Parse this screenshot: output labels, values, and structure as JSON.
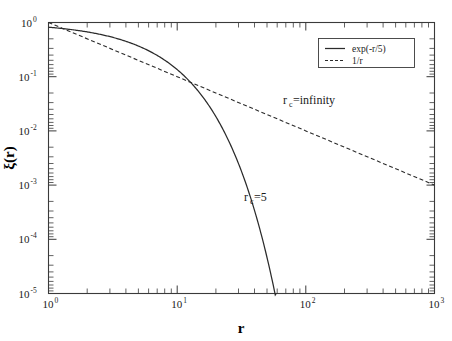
{
  "chart_data": {
    "type": "line",
    "title": "",
    "xlabel": "r",
    "ylabel": "ξ(r)",
    "xscale": "log",
    "yscale": "log",
    "xlim": [
      1,
      1000
    ],
    "ylim": [
      1e-05,
      1
    ],
    "grid": false,
    "legend_position": "top-right",
    "xticklabels": [
      "10",
      "10",
      "10",
      "10"
    ],
    "xtickexponents": [
      "0",
      "1",
      "2",
      "3"
    ],
    "xtickvalues": [
      1,
      10,
      100,
      1000
    ],
    "yticklabels": [
      "10",
      "10",
      "10",
      "10",
      "10",
      "10"
    ],
    "ytickexponents": [
      "0",
      "-1",
      "-2",
      "-3",
      "-4",
      "-5"
    ],
    "ytickvalues": [
      1,
      0.1,
      0.01,
      0.001,
      0.0001,
      1e-05
    ],
    "series": [
      {
        "name": "exp(-r/5)",
        "style": "solid",
        "color": "#2b2b2b",
        "formula": "exp(-r/5)",
        "x": [
          1,
          1.5,
          2,
          3,
          4,
          5,
          6,
          8,
          10,
          12,
          14,
          16,
          18,
          20,
          25,
          30,
          35,
          40,
          45,
          50,
          55,
          57.6
        ],
        "y": [
          0.8187,
          0.7408,
          0.6703,
          0.5488,
          0.4493,
          0.3679,
          0.3012,
          0.2019,
          0.1353,
          0.0907,
          0.0608,
          0.0408,
          0.0273,
          0.0183,
          0.00674,
          0.00248,
          0.000912,
          0.000335,
          0.000123,
          4.54e-05,
          1.67e-05,
          1e-05
        ]
      },
      {
        "name": "1/r",
        "style": "dashed",
        "color": "#2b2b2b",
        "formula": "1/r",
        "x": [
          1,
          10,
          100,
          1000
        ],
        "y": [
          1,
          0.1,
          0.01,
          0.001
        ]
      }
    ],
    "annotations": [
      {
        "text": "r",
        "subscript": "c",
        "suffix": "=infinity",
        "x_data": 60,
        "y_data": 0.028
      },
      {
        "text": "r",
        "subscript": "c",
        "suffix": "=5",
        "x_data": 27,
        "y_data": 0.0016
      }
    ],
    "legend": [
      {
        "label": "exp(-r/5)",
        "style": "solid"
      },
      {
        "label": "1/r",
        "style": "dashed"
      }
    ]
  }
}
